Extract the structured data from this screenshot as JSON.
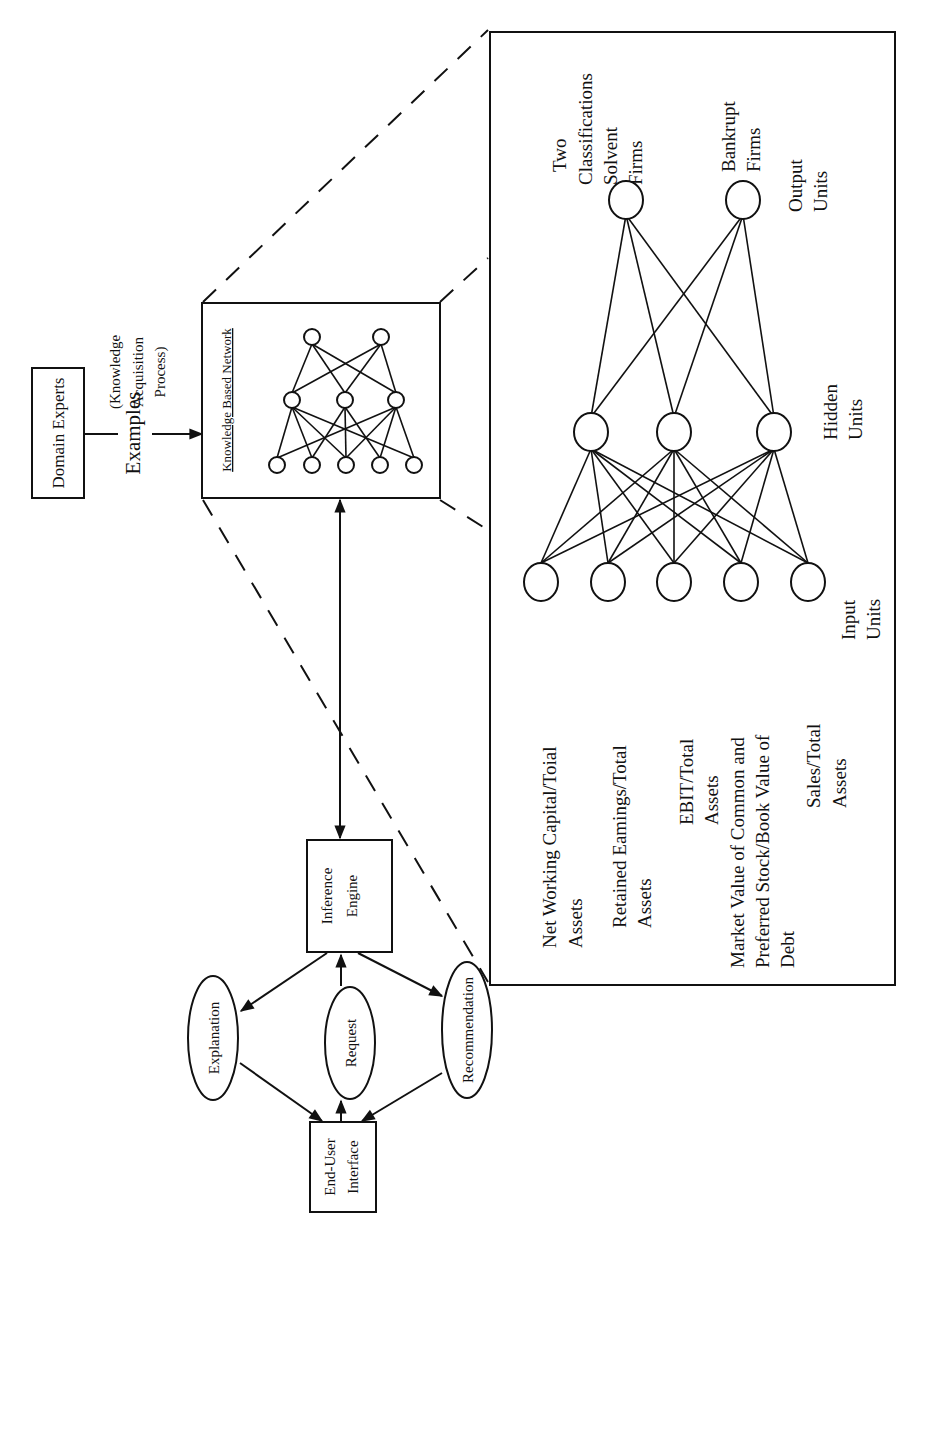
{
  "diagram": {
    "orientation": "rotated-90-ccw",
    "domain_experts": "Domain Experts",
    "examples": "Examples",
    "knowledge_acquisition": [
      "(Knowledge",
      "Acquisition",
      "Process)"
    ],
    "kbn_title": "Knowledge Based Network",
    "kbn_network": {
      "input_nodes": 5,
      "hidden_nodes": 3,
      "output_nodes": 2
    },
    "inference_engine": [
      "Inference",
      "Engine"
    ],
    "end_user_interface": [
      "End-User",
      "Interface"
    ],
    "ellipses": {
      "explanation": "Explanation",
      "request": "Request",
      "recommendation": "Recommendation"
    },
    "detail": {
      "output_header": [
        "Two",
        "Classifications"
      ],
      "outputs": [
        [
          "Solvent",
          "Firms"
        ],
        [
          "Bankrupt",
          "Firms"
        ]
      ],
      "output_units_label": [
        "Output",
        "Units"
      ],
      "hidden_units_label": [
        "Hidden",
        "Units"
      ],
      "input_units_label": [
        "Input",
        "Units"
      ],
      "network": {
        "input_nodes": 5,
        "hidden_nodes": 3,
        "output_nodes": 2,
        "fully_connected": true
      },
      "inputs": [
        [
          "Net Working Capital/Toial",
          "Assets"
        ],
        [
          "Retained Eamings/Total",
          "Assets"
        ],
        [
          "EBIT/Total",
          "Assets"
        ],
        [
          "Market Value of Common and",
          "Preferred Stock/Book Value of",
          "Debt"
        ],
        [
          "Sales/Total",
          "Assets"
        ]
      ]
    },
    "colors": {
      "ink": "#111111",
      "paper": "#ffffff"
    }
  }
}
